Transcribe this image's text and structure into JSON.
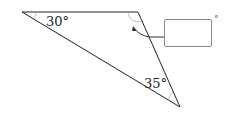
{
  "diagram": {
    "angles": [
      {
        "label": "30°",
        "vertex": "top-left"
      },
      {
        "label": "35°",
        "vertex": "bottom"
      },
      {
        "label": "?",
        "vertex": "top-right",
        "note": "answer box"
      }
    ],
    "answer_box": {
      "value": "",
      "unit": "°"
    },
    "colors": {
      "line": "#222222",
      "arc": "#999999"
    }
  }
}
